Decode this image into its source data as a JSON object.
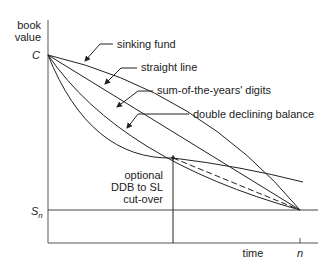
{
  "diagram": {
    "title": "",
    "y_axis_label": [
      "book",
      "value"
    ],
    "x_axis_label": "time",
    "initial_cost_label": "C",
    "salvage_label": "S",
    "salvage_subscript": "n",
    "end_label": "n",
    "curves": [
      {
        "name": "sinking fund",
        "shape": "concave"
      },
      {
        "name": "straight line",
        "shape": "linear"
      },
      {
        "name": "sum-of-the-years' digits",
        "shape": "convex"
      },
      {
        "name": "double declining balance",
        "shape": "convex-steep"
      }
    ],
    "cutover_label": [
      "optional",
      "DDB to SL",
      "cut-over"
    ],
    "line_color": "#222222",
    "background": "#ffffff"
  }
}
